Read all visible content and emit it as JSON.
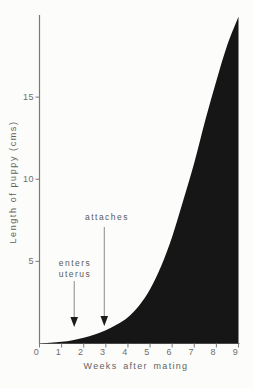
{
  "figure": {
    "background": "#fcfcfa",
    "fill_color": "#161616",
    "axis_color": "#7a7a7a",
    "text_color": "#5e5e5e",
    "arrow_line_color": "#8a8a8a",
    "arrow_head_color": "#1c1c1c"
  },
  "chart_data": {
    "type": "area",
    "title": "",
    "xlabel": "Weeks after mating",
    "ylabel": "Length of puppy (cms)",
    "xlim": [
      0,
      9
    ],
    "ylim": [
      0,
      20
    ],
    "grid": false,
    "legend": "none",
    "x_ticks": [
      0,
      1,
      2,
      3,
      4,
      5,
      6,
      7,
      8,
      9
    ],
    "y_ticks": [
      5,
      10,
      15
    ],
    "series": [
      {
        "name": "puppy-length",
        "x": [
          0,
          0.5,
          1,
          1.5,
          2,
          2.5,
          3,
          3.5,
          4,
          4.5,
          5,
          5.5,
          6,
          6.5,
          7,
          7.5,
          8,
          8.5,
          9
        ],
        "y": [
          0,
          0.05,
          0.1,
          0.2,
          0.35,
          0.55,
          0.8,
          1.15,
          1.6,
          2.3,
          3.3,
          4.7,
          6.5,
          8.7,
          11.0,
          13.6,
          16.0,
          18.2,
          19.9
        ]
      }
    ],
    "annotations": [
      {
        "text": "attaches",
        "lines": [
          "attaches"
        ],
        "week": 2.93,
        "arrow_top_y_px": 227,
        "arrow_tip_y_px": 326
      },
      {
        "text": "enters uterus",
        "lines": [
          "enters",
          "uterus"
        ],
        "week": 1.57,
        "arrow_top_y_px": 281,
        "arrow_tip_y_px": 327
      }
    ]
  }
}
